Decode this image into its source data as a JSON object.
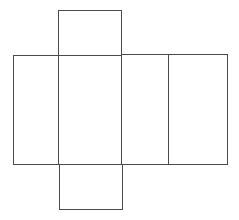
{
  "diagram": {
    "type": "cuboid-net",
    "stroke_color": "#4a4a4a",
    "background": "#ffffff",
    "faces": [
      {
        "name": "top-face",
        "x": 58,
        "y": 10,
        "w": 63,
        "h": 45
      },
      {
        "name": "left-face",
        "x": 13,
        "y": 55,
        "w": 45,
        "h": 109
      },
      {
        "name": "front-face",
        "x": 58,
        "y": 55,
        "w": 63,
        "h": 109
      },
      {
        "name": "right-face",
        "x": 121,
        "y": 54,
        "w": 47,
        "h": 110
      },
      {
        "name": "back-face",
        "x": 168,
        "y": 54,
        "w": 59,
        "h": 110
      },
      {
        "name": "bottom-face",
        "x": 59,
        "y": 164,
        "w": 63,
        "h": 45
      }
    ]
  }
}
